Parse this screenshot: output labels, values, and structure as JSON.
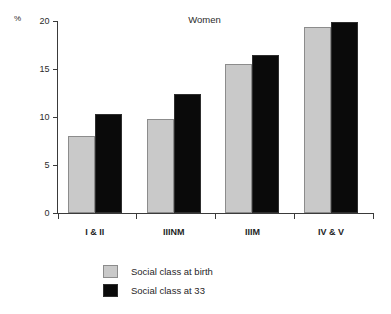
{
  "chart_data": {
    "type": "bar",
    "title": "Women",
    "xlabel": "",
    "ylabel": "%",
    "ylim": [
      0,
      20
    ],
    "yticks": [
      0,
      5,
      10,
      15,
      20
    ],
    "ytick_labels": [
      "0",
      "5",
      "10",
      "15",
      "20"
    ],
    "grid": false,
    "legend_position": "bottom-left",
    "categories": [
      "I & II",
      "IIINM",
      "IIIM",
      "IV & V"
    ],
    "series": [
      {
        "name": "Social class at birth",
        "color": "#c9c9c9",
        "values": [
          8.0,
          9.8,
          15.5,
          19.4
        ]
      },
      {
        "name": "Social class at 33",
        "color": "#0a0a0a",
        "values": [
          10.3,
          12.4,
          16.4,
          19.9
        ]
      }
    ]
  },
  "legend": {
    "items": [
      {
        "label": "Social class at birth"
      },
      {
        "label": "Social class at 33"
      }
    ]
  }
}
